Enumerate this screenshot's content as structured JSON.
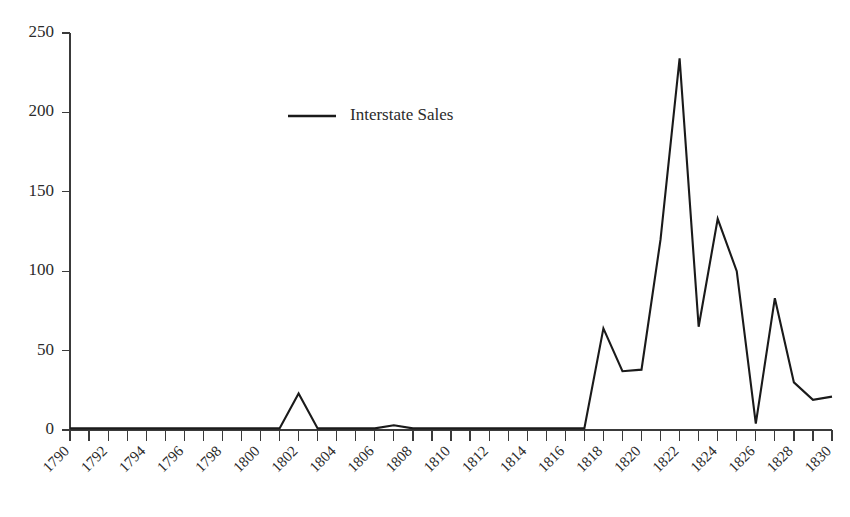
{
  "chart_data": {
    "type": "line",
    "title": "",
    "subtitle": "",
    "xlabel": "",
    "ylabel": "",
    "xlim": [
      1790,
      1830
    ],
    "ylim": [
      0,
      250
    ],
    "grid": false,
    "legend_position": "upper-center-left",
    "x": [
      1790,
      1791,
      1792,
      1793,
      1794,
      1795,
      1796,
      1797,
      1798,
      1799,
      1800,
      1801,
      1802,
      1803,
      1804,
      1805,
      1806,
      1807,
      1808,
      1809,
      1810,
      1811,
      1812,
      1813,
      1814,
      1815,
      1816,
      1817,
      1818,
      1819,
      1820,
      1821,
      1822,
      1823,
      1824,
      1825,
      1826,
      1827,
      1828,
      1829,
      1830
    ],
    "series": [
      {
        "name": "Interstate Sales",
        "color": "#1a1a1a",
        "values": [
          1,
          1,
          1,
          1,
          1,
          1,
          1,
          1,
          1,
          1,
          1,
          1,
          23,
          1,
          1,
          1,
          1,
          3,
          1,
          1,
          1,
          1,
          1,
          1,
          1,
          1,
          1,
          1,
          64,
          37,
          38,
          120,
          234,
          65,
          133,
          100,
          4,
          83,
          30,
          19,
          21
        ]
      }
    ],
    "y_ticks": [
      0,
      50,
      100,
      150,
      200,
      250
    ],
    "y_tick_labels": [
      "0",
      "50",
      "100",
      "150",
      "200",
      "250"
    ],
    "x_tick_labels": [
      "1790",
      "1792",
      "1794",
      "1796",
      "1798",
      "1800",
      "1802",
      "1804",
      "1806",
      "1808",
      "1810",
      "1812",
      "1814",
      "1816",
      "1818",
      "1820",
      "1822",
      "1824",
      "1826",
      "1828",
      "1830"
    ],
    "x_tick_label_years": [
      1790,
      1792,
      1794,
      1796,
      1798,
      1800,
      1802,
      1804,
      1806,
      1808,
      1810,
      1812,
      1814,
      1816,
      1818,
      1820,
      1822,
      1824,
      1826,
      1828,
      1830
    ],
    "x_minor_tick_years": [
      1790,
      1791,
      1792,
      1793,
      1794,
      1795,
      1796,
      1797,
      1798,
      1799,
      1800,
      1801,
      1802,
      1803,
      1804,
      1805,
      1806,
      1807,
      1808,
      1809,
      1810,
      1811,
      1812,
      1813,
      1814,
      1815,
      1816,
      1817,
      1818,
      1819,
      1820,
      1821,
      1822,
      1823,
      1824,
      1825,
      1826,
      1827,
      1828,
      1829,
      1830
    ]
  },
  "legend": {
    "entries": [
      {
        "label": "Interstate Sales"
      }
    ]
  },
  "colors": {
    "background": "#ffffff",
    "axis": "#3a3a3a",
    "line": "#1a1a1a",
    "text": "#2b2b2b"
  }
}
